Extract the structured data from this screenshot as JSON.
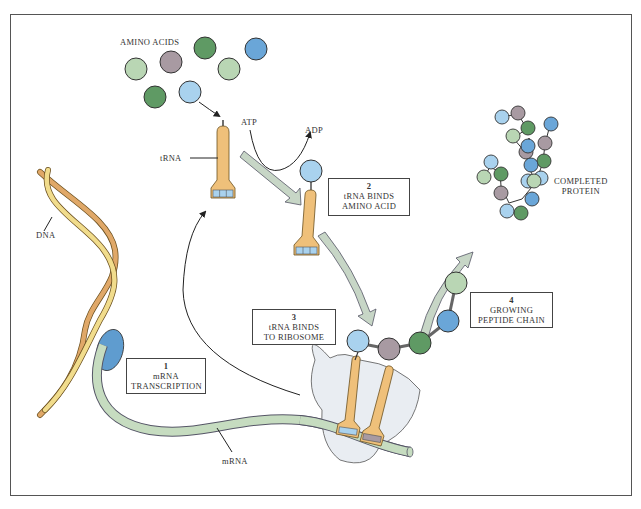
{
  "diagram": {
    "labels": {
      "amino_acids": "AMINO ACIDS",
      "trna": "tRNA",
      "atp": "ATP",
      "adp": "ADP",
      "dna": "DNA",
      "mrna": "mRNA",
      "completed_protein_line1": "COMPLETED",
      "completed_protein_line2": "PROTEIN"
    },
    "steps": [
      {
        "number": "1",
        "line1": "mRNA",
        "line2": "TRANSCRIPTION"
      },
      {
        "number": "2",
        "line1": "tRNA BINDS",
        "line2": "AMINO ACID"
      },
      {
        "number": "3",
        "line1": "tRNA BINDS",
        "line2": "TO RIBOSOME"
      },
      {
        "number": "4",
        "line1": "GROWING",
        "line2": "PEPTIDE CHAIN"
      }
    ],
    "colors": {
      "light_green": "#b9d6b4",
      "dark_green": "#5f9a64",
      "mauve": "#a89aa2",
      "mid_blue": "#6aa6d8",
      "light_blue": "#a9d2ee",
      "trna_orange": "#efc07a",
      "mrna_green": "#c6dcc0",
      "ribosome": "#e9edf2",
      "dna_yellow": "#f1dc8c",
      "dna_orange": "#e0a868",
      "polymerase_blue": "#5f9ccf",
      "arrow_fill": "#c7d6c6"
    }
  }
}
